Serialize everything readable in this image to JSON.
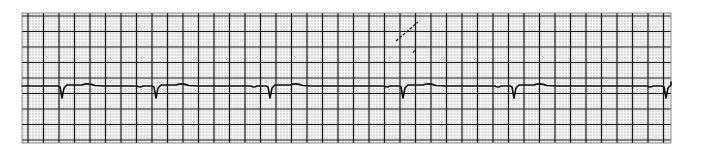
{
  "strip": {
    "type": "ecg-rhythm-strip",
    "grid": {
      "x": 22,
      "y": 13,
      "width": 649,
      "height": 130,
      "small_box_px": 3.1,
      "large_box_px": 15.5,
      "paper_color": "#d9d9d9",
      "thin_line_color": "#ffffff",
      "thick_line_color": "#1a1a1a"
    },
    "trace": {
      "color": "#111111",
      "baseline_y": 86,
      "qrs_depth_y": 98,
      "t_wave_peak_y": 82.5,
      "beats_x": [
        62,
        156,
        270,
        403,
        514,
        666
      ],
      "start_x": 22,
      "end_x": 671
    },
    "artifacts": [
      {
        "type": "diagonal-mark",
        "x1": 396,
        "y1": 41,
        "x2": 418,
        "y2": 22
      },
      {
        "type": "dot-mark",
        "x1": 413,
        "y1": 53,
        "x2": 415,
        "y2": 50
      }
    ]
  }
}
